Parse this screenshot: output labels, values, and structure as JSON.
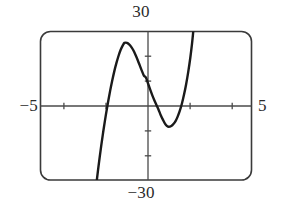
{
  "chart_data": {
    "type": "line",
    "title": "",
    "subtitle": "",
    "xlabel": "",
    "ylabel": "",
    "xlim": [
      -5,
      5
    ],
    "ylim": [
      -30,
      30
    ],
    "grid": false,
    "legend": null,
    "axis_labels": {
      "x_min_label": "−5",
      "x_max_label": "5",
      "y_min_label": "−30",
      "y_max_label": "30"
    },
    "x_ticks": [
      -4,
      -3,
      -2,
      -1,
      0,
      1,
      2,
      3,
      4
    ],
    "x_ticks_drawn": [
      -2,
      -1,
      1,
      2
    ],
    "y_ticks": [
      -20,
      -10,
      10,
      20
    ],
    "tick_spacing_x": 1,
    "tick_spacing_y": 10,
    "features": {
      "local_maximum": {
        "x": -1.02,
        "y": 25.4
      },
      "local_minimum": {
        "x": 1.07,
        "y": -8.5
      },
      "y_intercept": {
        "x": 0,
        "y": 11.3
      },
      "x_intercept": {
        "x": -2.0,
        "y": 0
      },
      "enters_window_at": {
        "x": -2.33,
        "y": -30
      },
      "exits_window_at": {
        "x": 2.24,
        "y": 30
      }
    },
    "series": [
      {
        "name": "cubic-curve",
        "color": "#1a1a1a",
        "points": [
          {
            "x": -2.33,
            "y": -30.0
          },
          {
            "x": -2.25,
            "y": -24.4
          },
          {
            "x": -2.15,
            "y": -17.9
          },
          {
            "x": -2.05,
            "y": -11.9
          },
          {
            "x": -2.0,
            "y": -9.0
          },
          {
            "x": -1.9,
            "y": -3.6
          },
          {
            "x": -1.8,
            "y": 1.4
          },
          {
            "x": -1.7,
            "y": 6.0
          },
          {
            "x": -1.6,
            "y": 10.2
          },
          {
            "x": -1.5,
            "y": 14.0
          },
          {
            "x": -1.4,
            "y": 17.3
          },
          {
            "x": -1.3,
            "y": 20.2
          },
          {
            "x": -1.2,
            "y": 22.6
          },
          {
            "x": -1.1,
            "y": 24.4
          },
          {
            "x": -1.02,
            "y": 25.4
          },
          {
            "x": -0.9,
            "y": 25.4
          },
          {
            "x": -0.8,
            "y": 24.8
          },
          {
            "x": -0.7,
            "y": 23.8
          },
          {
            "x": -0.6,
            "y": 22.4
          },
          {
            "x": -0.5,
            "y": 20.6
          },
          {
            "x": -0.4,
            "y": 18.6
          },
          {
            "x": -0.3,
            "y": 16.4
          },
          {
            "x": -0.2,
            "y": 14.2
          },
          {
            "x": -0.1,
            "y": 12.2
          },
          {
            "x": 0.0,
            "y": 11.3
          },
          {
            "x": 0.1,
            "y": 8.9
          },
          {
            "x": 0.2,
            "y": 6.5
          },
          {
            "x": 0.3,
            "y": 4.2
          },
          {
            "x": 0.4,
            "y": 2.1
          },
          {
            "x": 0.5,
            "y": 0.2
          },
          {
            "x": 0.6,
            "y": -1.7
          },
          {
            "x": 0.7,
            "y": -3.8
          },
          {
            "x": 0.8,
            "y": -5.6
          },
          {
            "x": 0.9,
            "y": -7.2
          },
          {
            "x": 1.0,
            "y": -8.2
          },
          {
            "x": 1.07,
            "y": -8.5
          },
          {
            "x": 1.2,
            "y": -8.2
          },
          {
            "x": 1.3,
            "y": -7.4
          },
          {
            "x": 1.4,
            "y": -6.2
          },
          {
            "x": 1.5,
            "y": -4.4
          },
          {
            "x": 1.6,
            "y": -2.1
          },
          {
            "x": 1.7,
            "y": 0.8
          },
          {
            "x": 1.8,
            "y": 4.4
          },
          {
            "x": 1.9,
            "y": 8.6
          },
          {
            "x": 2.0,
            "y": 13.6
          },
          {
            "x": 2.1,
            "y": 19.4
          },
          {
            "x": 2.18,
            "y": 25.0
          },
          {
            "x": 2.24,
            "y": 30.0
          }
        ]
      }
    ],
    "colors": {
      "curve": "#1a1a1a",
      "axis": "#4a4a4a",
      "frame": "#3a3a3a",
      "label": "#2b2b2b",
      "background": "#ffffff"
    }
  }
}
